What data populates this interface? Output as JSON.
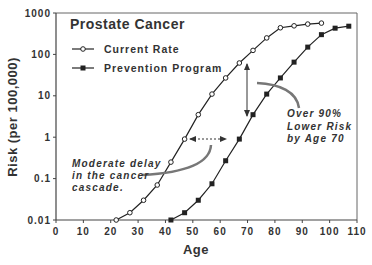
{
  "chart_data": {
    "type": "line",
    "title": "Prostate Cancer",
    "xlabel": "Age",
    "ylabel": "Risk (per 100,000)",
    "xlim": [
      0,
      110
    ],
    "ylim": [
      0.01,
      1000
    ],
    "yscale": "log",
    "grid": false,
    "legend_position": "upper-left",
    "x_ticks": [
      "0",
      "10",
      "20",
      "30",
      "40",
      "50",
      "60",
      "70",
      "80",
      "90",
      "100",
      "110"
    ],
    "y_ticks": [
      "0.01",
      "0.1",
      "1",
      "10",
      "100",
      "1000"
    ],
    "series": [
      {
        "name": "Current Rate",
        "marker": "open-circle",
        "x": [
          22,
          27,
          32,
          37,
          42,
          47,
          52,
          57,
          62,
          67,
          72,
          77,
          82,
          87,
          92,
          97
        ],
        "values": [
          0.01,
          0.015,
          0.03,
          0.07,
          0.25,
          0.9,
          3.5,
          11,
          27,
          62,
          125,
          250,
          440,
          490,
          540,
          570
        ]
      },
      {
        "name": "Prevention Program",
        "marker": "filled-square",
        "x": [
          42,
          47,
          52,
          57,
          62,
          67,
          72,
          77,
          82,
          87,
          92,
          97,
          102,
          107
        ],
        "values": [
          0.01,
          0.015,
          0.03,
          0.075,
          0.27,
          0.9,
          3.5,
          11,
          27,
          65,
          150,
          300,
          430,
          480
        ]
      }
    ],
    "annotations": [
      {
        "text": [
          "Moderate delay",
          "in the cancer",
          "cascade."
        ],
        "refers_to": "horizontal dotted double arrow at Risk≈0.9 between ages ~47 and ~63"
      },
      {
        "text": [
          "Over 90%",
          "Lower Risk",
          "by Age 70"
        ],
        "refers_to": "vertical double arrow at age ~70 between the two curves"
      }
    ]
  },
  "labels": {
    "title": "Prostate Cancer",
    "legend_current": "Current Rate",
    "legend_prevention": "Prevention Program",
    "xlabel": "Age",
    "ylabel": "Risk (per 100,000)",
    "annot_delay_1": "Moderate delay",
    "annot_delay_2": "in the cancer",
    "annot_delay_3": "cascade.",
    "annot_risk_1": "Over 90%",
    "annot_risk_2": "Lower Risk",
    "annot_risk_3": "by Age 70"
  },
  "colors": {
    "line": "#222222",
    "axis": "#555555",
    "annotation_curve": "#777777",
    "text": "#333333"
  }
}
